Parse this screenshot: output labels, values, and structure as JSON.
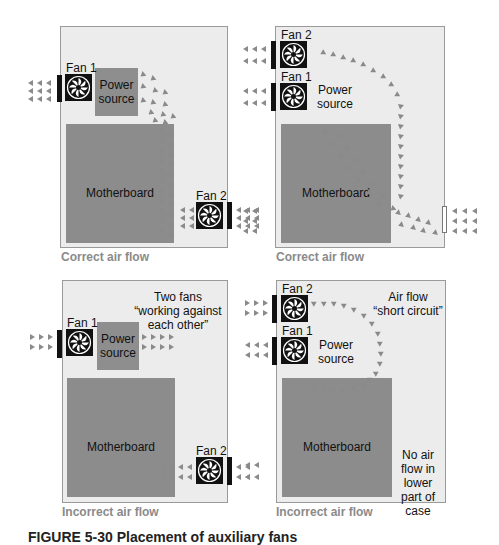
{
  "colors": {
    "case_fill": "#ececec",
    "board_fill": "#8c8c8c",
    "fan_fill": "#111111",
    "arrow": "#8a8a8a",
    "caption": "#8a8a8a"
  },
  "panels": [
    {
      "caption": "Correct air flow",
      "fan1_label": "Fan 1",
      "fan2_label": "Fan 2",
      "power_label": "Power source",
      "board_label": "Motherboard"
    },
    {
      "caption": "Correct air flow",
      "fan1_label": "Fan 1",
      "fan2_label": "Fan 2",
      "power_label": "Power source",
      "board_label": "Motherboard"
    },
    {
      "caption": "Incorrect air flow",
      "fan1_label": "Fan 1",
      "fan2_label": "Fan 2",
      "power_label": "Power source",
      "board_label": "Motherboard",
      "note": "Two fans “working against each other”"
    },
    {
      "caption": "Incorrect air flow",
      "fan1_label": "Fan 1",
      "fan2_label": "Fan 2",
      "power_label": "Power source",
      "board_label": "Motherboard",
      "note": "Air flow “short circuit”",
      "note2": "No air flow in lower part of case"
    }
  ],
  "figure_caption": "FIGURE 5-30   Placement of auxiliary fans"
}
